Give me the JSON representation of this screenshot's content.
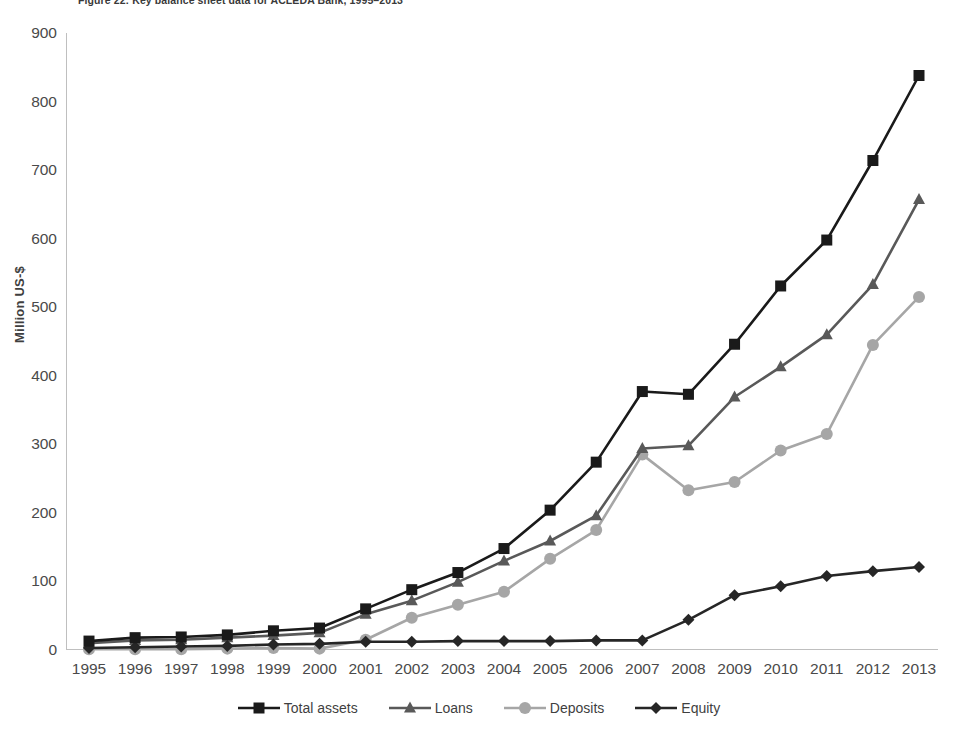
{
  "figure": {
    "caption": "Figure 22: Key balance sheet data for ACLEDA Bank, 1995–2013"
  },
  "axes": {
    "y_title": "Million US-$",
    "y_ticks": [
      "900",
      "800",
      "700",
      "600",
      "500",
      "400",
      "300",
      "200",
      "100",
      "0"
    ],
    "x_ticks": [
      "1995",
      "1996",
      "1997",
      "1998",
      "1999",
      "2000",
      "2001",
      "2002",
      "2003",
      "2004",
      "2005",
      "2006",
      "2007",
      "2008",
      "2009",
      "2010",
      "2011",
      "2012",
      "2013"
    ]
  },
  "legend": {
    "position": "bottom",
    "items": [
      {
        "label": "Total assets",
        "marker": "square-marker",
        "color": "#1a1a1a"
      },
      {
        "label": "Loans",
        "marker": "triangle-marker",
        "color": "#595959"
      },
      {
        "label": "Deposits",
        "marker": "circle-marker",
        "color": "#a6a6a6"
      },
      {
        "label": "Equity",
        "marker": "diamond-marker",
        "color": "#262626"
      }
    ]
  },
  "chart_data": {
    "type": "line",
    "title": "Figure 22: Key balance sheet data for ACLEDA Bank, 1995–2013",
    "xlabel": "",
    "ylabel": "Million US-$",
    "ylim": [
      0,
      900
    ],
    "ytick_step": 100,
    "grid": false,
    "legend_position": "bottom",
    "categories": [
      "1995",
      "1996",
      "1997",
      "1998",
      "1999",
      "2000",
      "2001",
      "2002",
      "2003",
      "2004",
      "2005",
      "2006",
      "2007",
      "2008",
      "2009",
      "2010",
      "2011",
      "2012",
      "2013"
    ],
    "series": [
      {
        "name": "Total assets",
        "color": "#1a1a1a",
        "marker": "square",
        "values": [
          13,
          18,
          19,
          22,
          28,
          32,
          60,
          88,
          113,
          148,
          204,
          274,
          377,
          373,
          446,
          531,
          598,
          714,
          838
        ]
      },
      {
        "name": "Loans",
        "color": "#595959",
        "marker": "triangle",
        "values": [
          10,
          14,
          15,
          18,
          21,
          25,
          52,
          72,
          99,
          130,
          159,
          196,
          294,
          298,
          369,
          413,
          460,
          533,
          657
        ]
      },
      {
        "name": "Deposits",
        "color": "#a6a6a6",
        "marker": "circle",
        "values": [
          1,
          1,
          1,
          2,
          3,
          2,
          15,
          47,
          66,
          85,
          133,
          175,
          285,
          233,
          245,
          291,
          315,
          445,
          515
        ]
      },
      {
        "name": "Equity",
        "color": "#262626",
        "marker": "diamond",
        "values": [
          3,
          4,
          5,
          6,
          8,
          9,
          12,
          12,
          13,
          13,
          13,
          14,
          14,
          44,
          80,
          93,
          108,
          115,
          121
        ]
      }
    ]
  }
}
